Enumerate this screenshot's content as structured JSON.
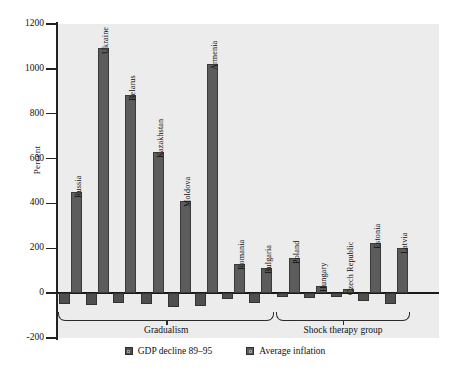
{
  "chart_data": {
    "type": "bar",
    "title": "",
    "xlabel": "",
    "ylabel": "Percent",
    "ylim": [
      -200,
      1200
    ],
    "ytick_values": [
      1200,
      1000,
      800,
      600,
      400,
      200,
      0,
      -200
    ],
    "ytick_labels": [
      "1200",
      "1000",
      "800",
      "600",
      "400",
      "200",
      "0",
      "-200"
    ],
    "grid": false,
    "legend_position": "bottom-center",
    "categories": [
      "Russia",
      "Ukraine",
      "Belarus",
      "Kazakhstan",
      "Moldova",
      "Armenia",
      "Romania",
      "Bulgaria",
      "Poland",
      "Hungary",
      "Czech Republic",
      "Estonia",
      "Latvia"
    ],
    "series": [
      {
        "name": "GDP decline 89-95",
        "values": [
          -48,
          -55,
          -42,
          -48,
          -62,
          -58,
          -28,
          -42,
          -17,
          -20,
          -16,
          -35,
          -48
        ]
      },
      {
        "name": "Average inflation",
        "values": [
          450,
          1095,
          885,
          630,
          410,
          1020,
          130,
          112,
          155,
          30,
          18,
          225,
          200
        ]
      }
    ],
    "groups": [
      {
        "label": "Gradualism",
        "start_index": 0,
        "end_index": 7
      },
      {
        "label": "Shock therapy group",
        "start_index": 8,
        "end_index": 12
      }
    ],
    "legend": [
      {
        "label": "GDP decline 89–95",
        "color": "#4f4f4f"
      },
      {
        "label": "Average inflation",
        "color": "#5c5c5c"
      }
    ],
    "colors": {
      "gdp_bar": "#4f4f4f",
      "inflation_bar": "#5c5c5c",
      "plot_background": "#ececed",
      "axis": "#222222",
      "text": "#111111"
    }
  }
}
